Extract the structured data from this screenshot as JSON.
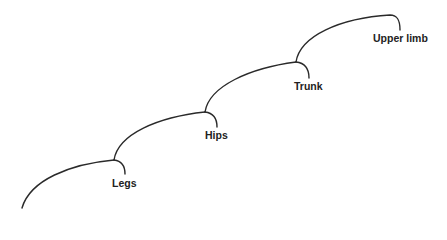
{
  "diagram": {
    "type": "cladogram",
    "line_color": "#2a2a2a",
    "text_color": "#222222",
    "nodes": [
      {
        "label": "Legs"
      },
      {
        "label": "Hips"
      },
      {
        "label": "Trunk"
      },
      {
        "label": "Upper limb"
      }
    ]
  }
}
